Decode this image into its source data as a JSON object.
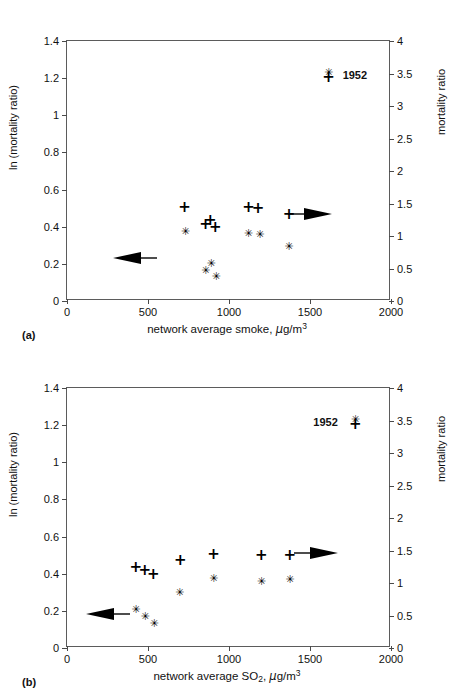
{
  "chart_data": [
    {
      "type": "scatter",
      "panel": "(a)",
      "title": "",
      "xlabel": "network average smoke, μg/m3",
      "xlabel_parts": {
        "pre": "network average smoke, ",
        "mu": "μ",
        "mid": "g/m",
        "sup": "3"
      },
      "ylabel": "ln (mortality ratio)",
      "ylabel_right": "mortality ratio",
      "xlim": [
        0,
        2000
      ],
      "ylim": [
        0,
        1.4
      ],
      "ylim_right": [
        0,
        4
      ],
      "xticks": [
        0,
        500,
        1000,
        1500,
        2000
      ],
      "xtick_labels": [
        "0",
        "500",
        "1000",
        "1500",
        "2000"
      ],
      "yticks": [
        0,
        0.2,
        0.4,
        0.6,
        0.8,
        1,
        1.2,
        1.4
      ],
      "ytick_labels": [
        "0",
        "0.2",
        "0.4",
        "0.6",
        "0.8",
        "1",
        "1.2",
        "1.4"
      ],
      "yticks_right": [
        0,
        0.5,
        1,
        1.5,
        2,
        2.5,
        3,
        3.5,
        4
      ],
      "ytick_labels_right": [
        "0",
        "0.5",
        "1",
        "1.5",
        "2",
        "2.5",
        "3",
        "3.5",
        "4"
      ],
      "grid": false,
      "legend": "none",
      "series": [
        {
          "name": "plus",
          "marker": "+",
          "points": [
            {
              "x": 725,
              "y": 0.505
            },
            {
              "x": 855,
              "y": 0.415
            },
            {
              "x": 885,
              "y": 0.435
            },
            {
              "x": 915,
              "y": 0.4
            },
            {
              "x": 1120,
              "y": 0.505
            },
            {
              "x": 1180,
              "y": 0.5
            },
            {
              "x": 1370,
              "y": 0.47
            }
          ]
        },
        {
          "name": "star",
          "marker": "*",
          "points": [
            {
              "x": 730,
              "y": 0.375
            },
            {
              "x": 855,
              "y": 0.165
            },
            {
              "x": 890,
              "y": 0.205
            },
            {
              "x": 920,
              "y": 0.135
            },
            {
              "x": 1120,
              "y": 0.365
            },
            {
              "x": 1190,
              "y": 0.362
            },
            {
              "x": 1370,
              "y": 0.297
            }
          ]
        }
      ],
      "annotations": [
        {
          "label": "1952",
          "marker": "both",
          "x": 1615,
          "y": 1.215,
          "label_side": "right"
        }
      ],
      "arrows": [
        {
          "direction": "right",
          "x": 1500,
          "y": 0.457,
          "meaning": "points-to-right-axis"
        },
        {
          "direction": "left",
          "x": 420,
          "y": 0.222,
          "meaning": "points-to-left-axis"
        }
      ]
    },
    {
      "type": "scatter",
      "panel": "(b)",
      "title": "",
      "xlabel": "network average SO2, μg/m3",
      "xlabel_parts": {
        "pre": "network average SO",
        "sub": "2",
        "comma": ", ",
        "mu": "μ",
        "mid": "g/m",
        "sup": "3"
      },
      "ylabel": "ln (mortality ratio)",
      "ylabel_right": "mortality ratio",
      "xlim": [
        0,
        2000
      ],
      "ylim": [
        0,
        1.4
      ],
      "ylim_right": [
        0,
        4
      ],
      "xticks": [
        0,
        500,
        1000,
        1500,
        2000
      ],
      "xtick_labels": [
        "0",
        "500",
        "1000",
        "1500",
        "2000"
      ],
      "yticks": [
        0,
        0.2,
        0.4,
        0.6,
        0.8,
        1,
        1.2,
        1.4
      ],
      "ytick_labels": [
        "0",
        "0.2",
        "0.4",
        "0.6",
        "0.8",
        "1",
        "1.2",
        "1.4"
      ],
      "yticks_right": [
        0,
        0.5,
        1,
        1.5,
        2,
        2.5,
        3,
        3.5,
        4
      ],
      "ytick_labels_right": [
        "0",
        "0.5",
        "1",
        "1.5",
        "2",
        "2.5",
        "3",
        "3.5",
        "4"
      ],
      "grid": false,
      "legend": "none",
      "series": [
        {
          "name": "plus",
          "marker": "+",
          "points": [
            {
              "x": 425,
              "y": 0.435
            },
            {
              "x": 480,
              "y": 0.418
            },
            {
              "x": 532,
              "y": 0.4
            },
            {
              "x": 700,
              "y": 0.475
            },
            {
              "x": 905,
              "y": 0.505
            },
            {
              "x": 1200,
              "y": 0.5
            },
            {
              "x": 1375,
              "y": 0.502
            }
          ]
        },
        {
          "name": "star",
          "marker": "*",
          "points": [
            {
              "x": 425,
              "y": 0.208
            },
            {
              "x": 482,
              "y": 0.17
            },
            {
              "x": 537,
              "y": 0.137
            },
            {
              "x": 695,
              "y": 0.3
            },
            {
              "x": 905,
              "y": 0.375
            },
            {
              "x": 1200,
              "y": 0.363
            },
            {
              "x": 1375,
              "y": 0.372
            }
          ]
        }
      ],
      "annotations": [
        {
          "label": "1952",
          "marker": "both",
          "x": 1780,
          "y": 1.215,
          "label_side": "left"
        }
      ],
      "arrows": [
        {
          "direction": "right",
          "x": 1540,
          "y": 0.5,
          "meaning": "points-to-right-axis"
        },
        {
          "direction": "left",
          "x": 255,
          "y": 0.175,
          "meaning": "points-to-left-axis"
        }
      ]
    }
  ]
}
